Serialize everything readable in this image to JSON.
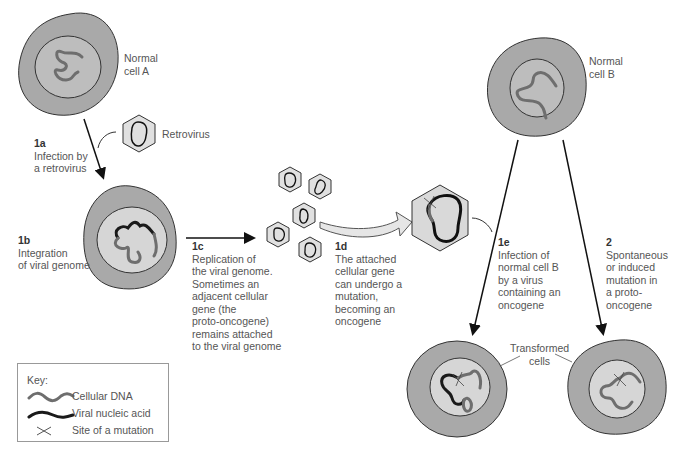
{
  "colors": {
    "cytoplasm": "#a9a9a9",
    "nucleus": "#d6d6d6",
    "cellular_dna": "#6e6e6e",
    "viral_nucleic_acid": "#1a1a1a",
    "virus_capsid": "#e0e0e0",
    "outline": "#333333"
  },
  "labels": {
    "normal_cell_a": "Normal\ncell A",
    "retrovirus": "Retrovirus",
    "normal_cell_b": "Normal\ncell B",
    "transformed_cells": "Transformed\ncells"
  },
  "steps": [
    {
      "id": "1a",
      "text": "Infection by\na retrovirus"
    },
    {
      "id": "1b",
      "text": "Integration\nof viral genome"
    },
    {
      "id": "1c",
      "text": "Replication of\nthe viral genome.\nSometimes an\nadjacent cellular\ngene (the\nproto-oncogene)\nremains attached\nto the viral genome"
    },
    {
      "id": "1d",
      "text": "The attached\ncellular gene\ncan undergo a\nmutation,\nbecoming an\noncogene"
    },
    {
      "id": "1e",
      "text": "Infection of\nnormal cell B\nby a virus\ncontaining an\noncogene"
    },
    {
      "id": "2",
      "text": "Spontaneous\nor induced\nmutation in\na proto-\noncogene"
    }
  ],
  "key": {
    "title": "Key:",
    "items": [
      {
        "symbol": "cellular-dna",
        "label": "Cellular DNA"
      },
      {
        "symbol": "viral-nucleic-acid",
        "label": "Viral nucleic acid"
      },
      {
        "symbol": "mutation-site",
        "label": "Site of a mutation"
      }
    ]
  }
}
